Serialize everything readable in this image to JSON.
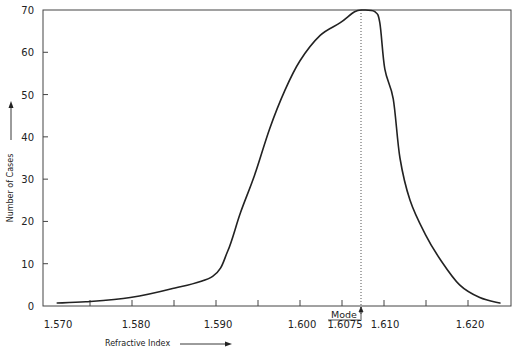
{
  "chart_data": {
    "type": "line",
    "title": "",
    "xlabel": "Refractive Index",
    "ylabel": "Number of Cases",
    "xlim": [
      1.5695,
      1.625
    ],
    "ylim": [
      0,
      70
    ],
    "grid": false,
    "legend": null,
    "x_ticks": [
      1.57,
      1.58,
      1.59,
      1.6,
      1.6075,
      1.61,
      1.62
    ],
    "x_tick_labels": [
      "1.570",
      "1.580",
      "1.590",
      "1.600",
      "1.6075",
      "1.610",
      "1.620"
    ],
    "x_minor_ticks": [
      1.575,
      1.58,
      1.585,
      1.59,
      1.595,
      1.6,
      1.605,
      1.61,
      1.615,
      1.62
    ],
    "y_ticks": [
      0,
      10,
      20,
      30,
      40,
      50,
      60,
      70
    ],
    "y_tick_labels": [
      "0",
      "10",
      "20",
      "30",
      "40",
      "50",
      "60",
      "70"
    ],
    "annotations": [
      {
        "text": "Mode",
        "x": 1.6075,
        "style": "underlined with up-arrow, dotted vertical line at mode"
      }
    ],
    "series": [
      {
        "name": "Number of Cases",
        "x": [
          1.5711,
          1.5745,
          1.5798,
          1.5846,
          1.5896,
          1.5914,
          1.5929,
          1.5946,
          1.5964,
          1.5982,
          1.6,
          1.6024,
          1.6048,
          1.6065,
          1.6075,
          1.6089,
          1.6095,
          1.6101,
          1.6111,
          1.6119,
          1.6131,
          1.6149,
          1.6167,
          1.619,
          1.6214,
          1.6238
        ],
        "y": [
          0.7,
          1,
          2,
          4,
          7,
          13,
          22,
          31,
          42,
          51,
          58,
          64,
          67,
          69.6,
          70,
          69.6,
          67,
          56,
          49,
          35,
          25,
          17,
          11,
          5,
          2,
          0.7
        ]
      }
    ]
  },
  "labels": {
    "mode": "Mode",
    "mode_value": "1.6075",
    "x_axis_title": "Refractive Index",
    "y_axis_title": "Number of Cases"
  }
}
